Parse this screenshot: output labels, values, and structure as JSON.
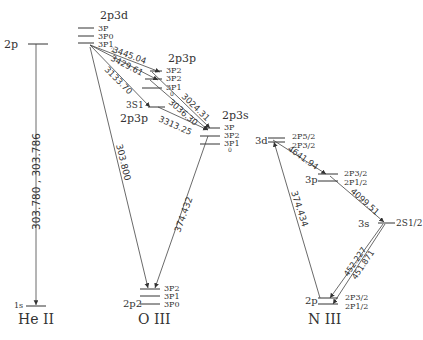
{
  "ions": [
    {
      "name": "He II",
      "upper": "2p",
      "lower": "1s"
    },
    {
      "name": "O III"
    },
    {
      "name": "N III"
    }
  ],
  "heII": {
    "line_label": "303.780 , 303.786"
  },
  "oIII": {
    "config_2p3d": "2p3d",
    "terms_2p3d": [
      "3P",
      "3P0",
      "3P1",
      "2"
    ],
    "config_2p3p_top": "2p3p",
    "terms_2p3p_top": [
      "3P2",
      "3P2",
      "3P1",
      "0"
    ],
    "term_3S1": "3S1",
    "config_2p3p_mid": "2p3p",
    "config_2p3s": "2p3s",
    "terms_2p3s": [
      "3P",
      "3P2",
      "3P1",
      "0"
    ],
    "config_ground": "2p2",
    "terms_ground": [
      "3P2",
      "3P1",
      "3P0"
    ],
    "lines": {
      "l3445": "3445.04",
      "l3429": "3429.61",
      "l3133": "3133.70",
      "l3024": "3024.31",
      "l3036": "3036.30",
      "l3313": "3313.25",
      "l303800": "303.800",
      "l374432": "374.432"
    }
  },
  "nIII": {
    "config_3d": "3d",
    "terms_3d": [
      "2P5/2",
      "2P3/2"
    ],
    "config_3p": "3p",
    "terms_3p": [
      "2P3/2",
      "2P1/2"
    ],
    "config_3s": "3s",
    "term_3s": "2S1/2",
    "config_2p": "2p",
    "terms_2p": [
      "2P3/2",
      "2P1/2"
    ],
    "lines": {
      "l4641": "4641.94",
      "l4099": "4099.51",
      "l374434": "374.434",
      "l452": "452.227",
      "l451": "451.871"
    }
  }
}
